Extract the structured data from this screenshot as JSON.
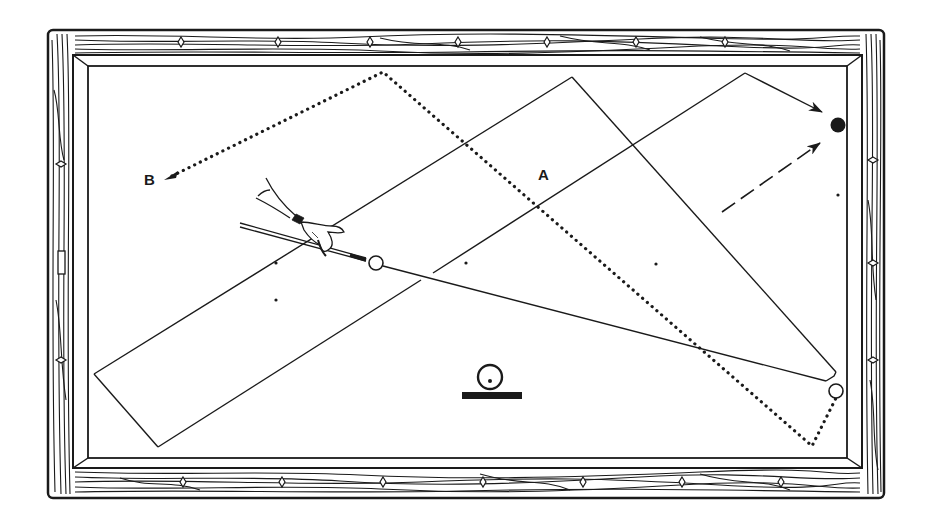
{
  "figure": {
    "type": "billiards-table-diagram",
    "colors": {
      "ink": "#1a1a1a",
      "paper": "#ffffff"
    }
  },
  "labels": {
    "path_a": "A",
    "path_b": "B"
  },
  "table": {
    "top_rail_diamonds": 7,
    "bottom_rail_diamonds": 7,
    "right_rail_diamonds": 3,
    "left_rail_diamonds": 2
  },
  "balls": {
    "cue_ball": {
      "x": 376,
      "y": 263,
      "fill": "white"
    },
    "object_ball": {
      "x": 836,
      "y": 391,
      "fill": "white"
    },
    "target_ball": {
      "x": 838,
      "y": 125,
      "fill": "black"
    }
  },
  "symbols": {
    "center_marker": "ball-on-base-icon"
  }
}
